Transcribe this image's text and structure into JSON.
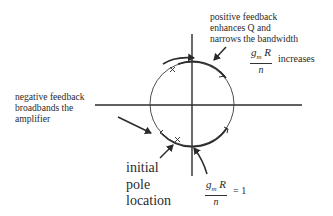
{
  "diagram": {
    "colors": {
      "line": "#2b2b2b",
      "background": "#ffffff"
    },
    "annotations": {
      "positive_feedback": [
        "positive feedback",
        "enhances Q and",
        "narrows the bandwidth"
      ],
      "negative_feedback": [
        "negative feedback",
        "broadbands the",
        "amplifier"
      ],
      "initial_pole": [
        "initial",
        "pole",
        "location"
      ],
      "increases_formula": {
        "numerator_g": "g",
        "numerator_sub": "m",
        "numerator_R": " R",
        "denominator": "n",
        "suffix": "increases"
      },
      "unity_formula": {
        "numerator_g": "g",
        "numerator_sub": "m",
        "numerator_R": " R",
        "denominator": "n",
        "suffix": "= 1"
      }
    },
    "elements": {
      "axes": [
        "real-axis",
        "imaginary-axis"
      ],
      "locus": "circle",
      "pole_marks": [
        "x-mark-upper-left",
        "x-mark-lower-left",
        "x-mark-bottom"
      ],
      "arrows": [
        "positive-feedback-arrow",
        "negative-feedback-arrow",
        "initial-pole-arrow",
        "unity-arrow",
        "direction-arrow-top"
      ]
    }
  }
}
